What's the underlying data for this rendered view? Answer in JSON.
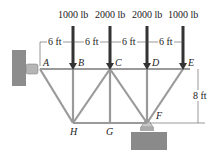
{
  "loads": [
    {
      "label": "1000 lb",
      "joint": "B"
    },
    {
      "label": "2000 lb",
      "joint": "C"
    },
    {
      "label": "2000 lb",
      "joint": "D"
    },
    {
      "label": "1000 lb",
      "joint": "E"
    }
  ],
  "spacing": [
    "6 ft",
    "6 ft",
    "6 ft",
    "6 ft"
  ],
  "height": "8 ft",
  "joints": {
    "A": "A",
    "B": "B",
    "C": "C",
    "D": "D",
    "E": "E",
    "F": "F",
    "G": "G",
    "H": "H"
  },
  "colors": {
    "member": "#9a9a9a",
    "arrow": "#333333",
    "ground": "#8a8a8a"
  }
}
